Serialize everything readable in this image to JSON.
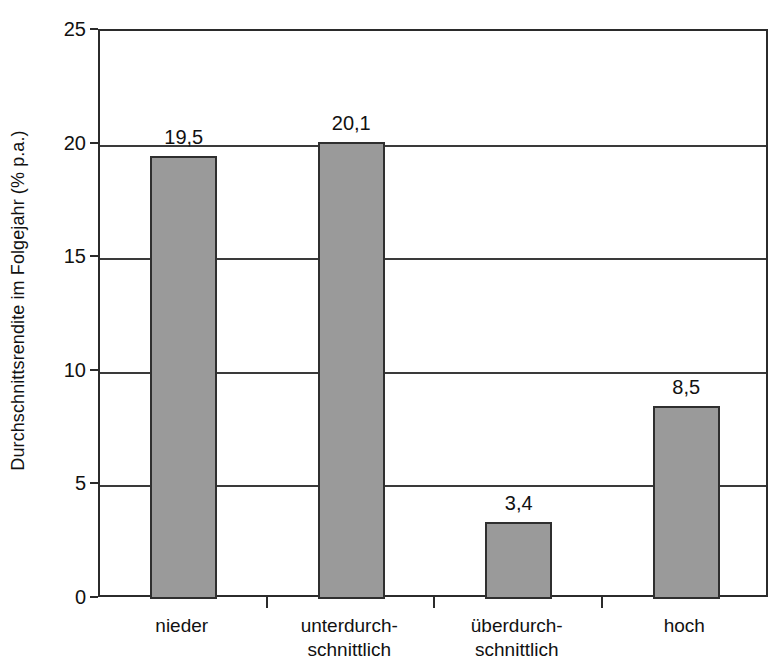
{
  "chart_data": {
    "type": "bar",
    "title": "",
    "subtitle": "",
    "xlabel": "",
    "ylabel": "Durchschnittsrendite im Folgejahr (% p.a.)",
    "categories": [
      "nieder",
      "unterdurch-\nschnittlich",
      "überdurch-\nschnittlich",
      "hoch"
    ],
    "category_lines": [
      [
        "nieder"
      ],
      [
        "unterdurch-",
        "schnittlich"
      ],
      [
        "überdurch-",
        "schnittlich"
      ],
      [
        "hoch"
      ]
    ],
    "values": [
      19.5,
      20.1,
      3.4,
      8.5
    ],
    "value_labels": [
      "19,5",
      "20,1",
      "3,4",
      "8,5"
    ],
    "ylim": [
      0,
      25
    ],
    "ytick_values": [
      0,
      5,
      10,
      15,
      20,
      25
    ],
    "ytick_labels": [
      "0",
      "5",
      "10",
      "15",
      "20",
      "25"
    ],
    "grid": true,
    "grid_axis": "y",
    "legend": null,
    "legend_position": "none",
    "bar_color": "#9a9a9a",
    "bar_border_color": "#2f2f2f",
    "axis_color": "#2b2b2b",
    "gridline_color": "#3a3a3a",
    "background_color": "#ffffff",
    "text_color": "#111111",
    "annotations": []
  }
}
